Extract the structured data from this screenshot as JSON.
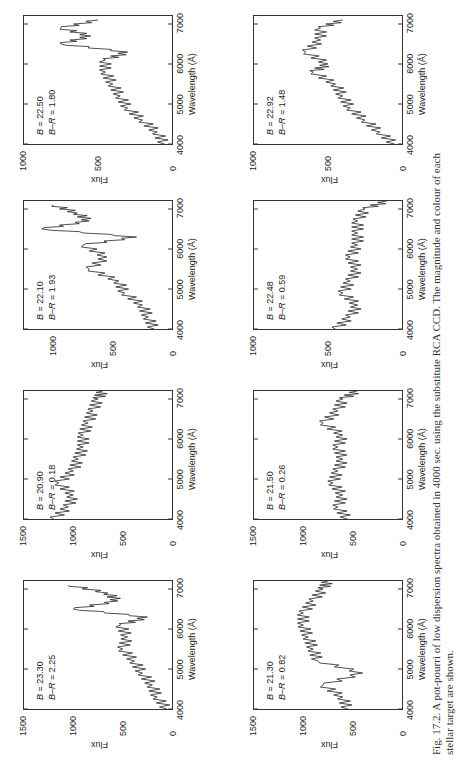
{
  "caption": {
    "line1": "Fig. 17.2.  A pot-pourri of low dispersion spectra obtained in 4000 sec. using the substitute RCA CCD. The magnitude and colour of each",
    "line2": "stellar target are shown."
  },
  "axis": {
    "xlabel": "Wavelength (Å)",
    "ylabel": "Flux",
    "xticks": [
      "4000",
      "5000",
      "6000",
      "7000"
    ]
  },
  "chart_data": [
    {
      "type": "line",
      "title": "B = 23.30  B−R = 2.25",
      "B": "23.30",
      "BR": "2.25",
      "xlabel": "Wavelength (Å)",
      "ylabel": "Flux",
      "xlim": [
        4000,
        7200
      ],
      "ylim": [
        0,
        1500
      ],
      "yticks": [
        "1500",
        "1000",
        "500",
        "0"
      ],
      "x": [
        4000,
        4300,
        4600,
        4900,
        5200,
        5500,
        5800,
        6100,
        6300,
        6500,
        6700,
        6900,
        7100
      ],
      "y": [
        50,
        150,
        200,
        300,
        380,
        500,
        450,
        520,
        250,
        1000,
        550,
        650,
        1050
      ]
    },
    {
      "type": "line",
      "title": "B = 21.30  B−R = 0.82",
      "B": "21.30",
      "BR": "0.82",
      "xlabel": "Wavelength (Å)",
      "ylabel": "Flux",
      "xlim": [
        4000,
        7200
      ],
      "ylim": [
        0,
        1500
      ],
      "yticks": [
        "1500",
        "1000",
        "500",
        "0"
      ],
      "x": [
        4000,
        4300,
        4600,
        4900,
        5200,
        5500,
        5800,
        6100,
        6400,
        6700,
        7000,
        7200
      ],
      "y": [
        550,
        600,
        800,
        400,
        850,
        900,
        950,
        1000,
        1000,
        900,
        800,
        750
      ]
    },
    {
      "type": "line",
      "title": "B = 20.90  B−R = 0.18",
      "B": "20.90",
      "BR": "0.18",
      "xlabel": "Wavelength (Å)",
      "ylabel": "Flux",
      "xlim": [
        4000,
        7200
      ],
      "ylim": [
        0,
        1500
      ],
      "yticks": [
        "1500",
        "1000",
        "500",
        "0"
      ],
      "x": [
        4000,
        4300,
        4600,
        4900,
        5200,
        5500,
        5800,
        6100,
        6400,
        6700,
        7000,
        7200
      ],
      "y": [
        1200,
        1050,
        1000,
        1150,
        1000,
        950,
        900,
        900,
        850,
        800,
        750,
        700
      ]
    },
    {
      "type": "line",
      "title": "B = 21.50  B−R = 0.26",
      "B": "21.50",
      "BR": "0.26",
      "xlabel": "Wavelength (Å)",
      "ylabel": "Flux",
      "xlim": [
        4000,
        7200
      ],
      "ylim": [
        0,
        1500
      ],
      "yticks": [
        "1500",
        "1000",
        "500",
        "0"
      ],
      "x": [
        4000,
        4300,
        4600,
        4900,
        5200,
        5500,
        5800,
        6100,
        6400,
        6700,
        7000,
        7200
      ],
      "y": [
        550,
        650,
        600,
        700,
        650,
        600,
        650,
        600,
        800,
        650,
        600,
        450
      ]
    },
    {
      "type": "line",
      "title": "B = 22.10  B−R = 1.93",
      "B": "22.10",
      "BR": "1.93",
      "xlabel": "Wavelength (Å)",
      "ylabel": "Flux",
      "xlim": [
        4000,
        7200
      ],
      "ylim": [
        0,
        1250
      ],
      "yticks": [
        "1000",
        "500",
        "0"
      ],
      "x": [
        4000,
        4300,
        4600,
        4900,
        5200,
        5500,
        5800,
        6100,
        6300,
        6500,
        6700,
        6900,
        7100
      ],
      "y": [
        150,
        200,
        250,
        400,
        450,
        700,
        550,
        750,
        300,
        1100,
        700,
        800,
        1000
      ]
    },
    {
      "type": "line",
      "title": "B = 22.48  B−R = 0.59",
      "B": "22.48",
      "BR": "0.59",
      "xlabel": "Wavelength (Å)",
      "ylabel": "Flux",
      "xlim": [
        4000,
        7200
      ],
      "ylim": [
        0,
        1000
      ],
      "yticks": [
        "1000",
        "500",
        "0"
      ],
      "x": [
        4000,
        4300,
        4600,
        4900,
        5200,
        5500,
        5800,
        6100,
        6400,
        6700,
        7000,
        7200
      ],
      "y": [
        450,
        350,
        300,
        400,
        350,
        300,
        350,
        300,
        300,
        300,
        250,
        100
      ]
    },
    {
      "type": "line",
      "title": "B = 22.50  B−R = 1.80",
      "B": "22.50",
      "BR": "1.80",
      "xlabel": "Wavelength (Å)",
      "ylabel": "Flux",
      "xlim": [
        4000,
        7200
      ],
      "ylim": [
        0,
        1000
      ],
      "yticks": [
        "1000",
        "500",
        "0"
      ],
      "x": [
        4000,
        4300,
        4600,
        4900,
        5200,
        5500,
        5800,
        6100,
        6300,
        6500,
        6700,
        6900,
        7100
      ],
      "y": [
        50,
        100,
        200,
        300,
        350,
        400,
        450,
        450,
        300,
        750,
        550,
        750,
        500
      ]
    },
    {
      "type": "line",
      "title": "B = 22.92  B−R = 1.48",
      "B": "22.92",
      "BR": "1.48",
      "xlabel": "Wavelength (Å)",
      "ylabel": "Flux",
      "xlim": [
        4000,
        7200
      ],
      "ylim": [
        0,
        1000
      ],
      "yticks": [
        "1000",
        "500",
        "0"
      ],
      "x": [
        4000,
        4300,
        4600,
        4900,
        5200,
        5500,
        5800,
        6000,
        6300,
        6600,
        6900,
        7100
      ],
      "y": [
        50,
        150,
        250,
        350,
        400,
        450,
        600,
        500,
        650,
        550,
        550,
        400
      ]
    }
  ]
}
